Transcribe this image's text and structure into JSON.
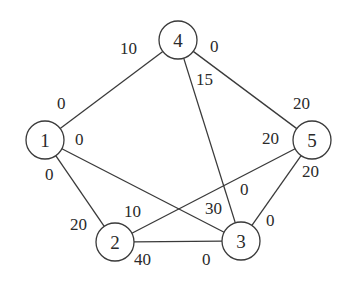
{
  "graph": {
    "nodes": [
      {
        "id": "1",
        "label": "1",
        "x": 45,
        "y": 140
      },
      {
        "id": "2",
        "label": "2",
        "x": 115,
        "y": 242
      },
      {
        "id": "3",
        "label": "3",
        "x": 241,
        "y": 241
      },
      {
        "id": "4",
        "label": "4",
        "x": 178,
        "y": 40
      },
      {
        "id": "5",
        "label": "5",
        "x": 312,
        "y": 140
      }
    ],
    "node_radius": 19,
    "edges": [
      {
        "from": "1",
        "to": "4",
        "label_from": "0",
        "label_to": "10"
      },
      {
        "from": "4",
        "to": "5",
        "label_from": "0",
        "label_to": "20"
      },
      {
        "from": "4",
        "to": "3",
        "label_from": "15",
        "label_to": "0"
      },
      {
        "from": "1",
        "to": "3",
        "label_from": "0",
        "label_to": "30"
      },
      {
        "from": "1",
        "to": "2",
        "label_from": "0",
        "label_to": "20"
      },
      {
        "from": "2",
        "to": "5",
        "label_from": "10",
        "label_to": "20"
      },
      {
        "from": "2",
        "to": "3",
        "label_from": "40",
        "label_to": "0"
      },
      {
        "from": "5",
        "to": "3",
        "label_from": "20",
        "label_to": "0"
      }
    ],
    "edge_labels": [
      {
        "text": "10",
        "x": 120,
        "y": 54
      },
      {
        "text": "0",
        "x": 57,
        "y": 109
      },
      {
        "text": "0",
        "x": 210,
        "y": 52
      },
      {
        "text": "20",
        "x": 293,
        "y": 109
      },
      {
        "text": "15",
        "x": 196,
        "y": 85
      },
      {
        "text": "0",
        "x": 240,
        "y": 195
      },
      {
        "text": "0",
        "x": 75,
        "y": 145
      },
      {
        "text": "30",
        "x": 205,
        "y": 214
      },
      {
        "text": "0",
        "x": 45,
        "y": 180
      },
      {
        "text": "20",
        "x": 70,
        "y": 230
      },
      {
        "text": "10",
        "x": 124,
        "y": 217
      },
      {
        "text": "20",
        "x": 262,
        "y": 144
      },
      {
        "text": "40",
        "x": 134,
        "y": 265
      },
      {
        "text": "0",
        "x": 202,
        "y": 265
      },
      {
        "text": "20",
        "x": 302,
        "y": 177
      },
      {
        "text": "0",
        "x": 266,
        "y": 226
      }
    ]
  }
}
